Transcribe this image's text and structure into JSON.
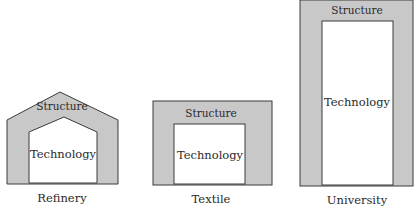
{
  "colors": {
    "structure_fill": "#c8c8c8",
    "technology_fill": "#ffffff",
    "stroke": "#3a3a3a",
    "text": "#2a2a2a"
  },
  "diagrams": [
    {
      "name": "Refinery",
      "shape": "house",
      "structure_label": "Structure",
      "technology_label": "Technology",
      "caption": "Refinery"
    },
    {
      "name": "Textile",
      "shape": "square",
      "structure_label": "Structure",
      "technology_label": "Technology",
      "caption": "Textile"
    },
    {
      "name": "University",
      "shape": "tall-rectangle",
      "structure_label": "Structure",
      "technology_label": "Technology",
      "caption": "University"
    }
  ]
}
